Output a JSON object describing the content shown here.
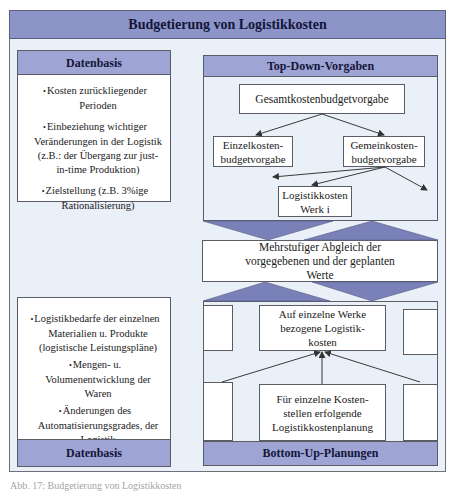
{
  "diagram": {
    "title": "Budgetierung von Logistikkosten",
    "colors": {
      "header_fill": "#9ea4d3",
      "title_fill": "#8c94c8",
      "triangle_fill": "#7a80b8",
      "background": "#eaf0f7",
      "box_fill": "#ffffff",
      "border": "#5b5d66"
    },
    "left_top": {
      "header": "Datenbasis",
      "bullets": [
        "Kosten zurückliegender Perioden",
        "Einbeziehung wichtiger Veränderungen in der Logistik (z.B.: der Übergang zur just-in-time Produktion)",
        "Zielstellung (z.B. 3%ige Rationalisierung)"
      ]
    },
    "left_bottom": {
      "header": "Datenbasis",
      "bullets": [
        "Logistikbedarfe der einzelnen Materialien u. Produkte (logistische Leistungspläne)",
        "Mengen- u. Volumenentwicklung der Waren",
        "Änderungen des Automatisierungsgrades, der Logistik",
        "einzuhaltender Servicegrad"
      ]
    },
    "top_down": {
      "header": "Top-Down-Vorgaben",
      "nodes": {
        "gesamt": "Gesamtkostenbudgetvorgabe",
        "einzel": "Einzelkosten-budgetvorgabe",
        "gemein": "Gemeinkosten-budgetvorgabe",
        "werk": "Logistikkosten Werk i"
      }
    },
    "reconciliation": "Mehrstufiger Abgleich der vorgegebenen und der geplanten Werte",
    "bottom_up": {
      "header": "Bottom-Up-Planungen",
      "nodes": {
        "werke": "Auf einzelne Werke bezogene Logistik-kosten",
        "kostenstellen": "Für einzelne Kosten-stellen erfolgende Logistikkostenplanung"
      }
    },
    "caption": "Abb. 17: Budgetierung von Logistikkosten"
  }
}
